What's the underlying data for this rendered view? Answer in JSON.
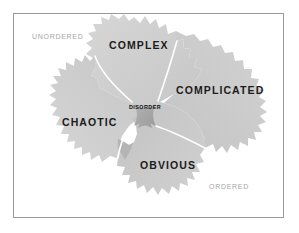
{
  "diagram": {
    "axis": {
      "left_label": "UNORDERED",
      "right_label": "ORDERED"
    },
    "domains": [
      {
        "id": "complex",
        "label": "COMPLEX"
      },
      {
        "id": "complicated",
        "label": "COMPLICATED"
      },
      {
        "id": "chaotic",
        "label": "CHAOTIC"
      },
      {
        "id": "obvious",
        "label": "OBVIOUS"
      },
      {
        "id": "disorder",
        "label": "DISORDER"
      }
    ],
    "colors": {
      "page_background": "#ffffff",
      "frame_border": "#9a9a9a",
      "region_fill": "#c9c9c9",
      "region_fill_light": "#d4d4d4",
      "disorder_fill": "#a8a8a8",
      "divider": "#ffffff",
      "domain_text": "#1b1b1b",
      "axis_text": "#a6a6a6"
    }
  }
}
